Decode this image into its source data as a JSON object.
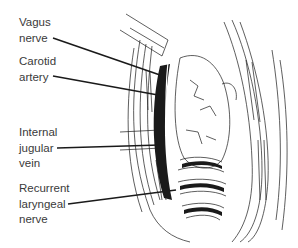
{
  "figure": {
    "labels": [
      {
        "id": "vagus-nerve",
        "lines": [
          "Vagus",
          "nerve"
        ]
      },
      {
        "id": "carotid-artery",
        "lines": [
          "Carotid",
          "artery"
        ]
      },
      {
        "id": "internal-jugular-vein",
        "lines": [
          "Internal",
          "jugular",
          "vein"
        ]
      },
      {
        "id": "recurrent-laryngeal-nerve",
        "lines": [
          "Recurrent",
          "laryngeal",
          "nerve"
        ]
      }
    ],
    "colors": {
      "ink": "#1a1a1a",
      "label_text": "#3a3a3a",
      "background": "#ffffff"
    }
  }
}
